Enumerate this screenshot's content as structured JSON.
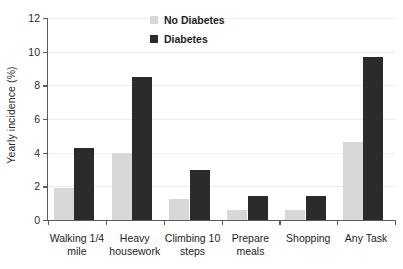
{
  "chart_data": {
    "type": "bar",
    "title": "",
    "xlabel": "",
    "ylabel": "Yearly incidence (%)",
    "ylim": [
      0,
      12
    ],
    "yticks": [
      0,
      2,
      4,
      6,
      8,
      10,
      12
    ],
    "ytick_labels": [
      "0",
      "2",
      "4",
      "6",
      "8",
      "10",
      "12"
    ],
    "grid": true,
    "legend_position": "top-center",
    "categories": [
      "Walking 1/4 mile",
      "Heavy housework",
      "Climbing 10 steps",
      "Prepare meals",
      "Shopping",
      "Any Task"
    ],
    "category_lines": [
      [
        "Walking 1/4",
        "mile"
      ],
      [
        "Heavy",
        "housework"
      ],
      [
        "Climbing 10",
        "steps"
      ],
      [
        "Prepare",
        "meals"
      ],
      [
        "Shopping",
        ""
      ],
      [
        "Any Task",
        ""
      ]
    ],
    "series": [
      {
        "name": "No Diabetes",
        "color": "#d8d8d8",
        "values": [
          1.9,
          4.0,
          1.25,
          0.6,
          0.6,
          4.65
        ]
      },
      {
        "name": "Diabetes",
        "color": "#2b2b2b",
        "values": [
          4.3,
          8.5,
          3.0,
          1.45,
          1.4,
          9.7
        ]
      }
    ]
  }
}
